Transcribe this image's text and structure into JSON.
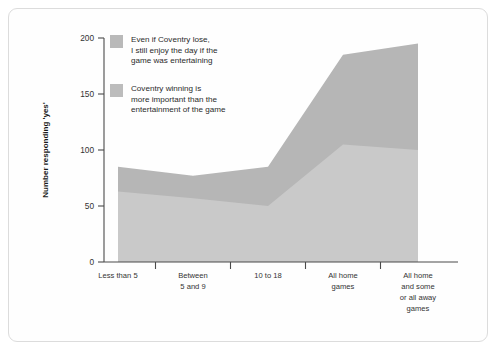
{
  "chart_data": {
    "type": "area",
    "title": "",
    "subtitle": "",
    "xlabel": "",
    "ylabel": "Number responding 'yes'",
    "ylim": [
      0,
      200
    ],
    "yticks": [
      0,
      50,
      100,
      150,
      200
    ],
    "ytick_labels": [
      "0",
      "50",
      "100",
      "150",
      "200"
    ],
    "grid": false,
    "stacked": false,
    "legend_position": "top-left inside plot",
    "categories": [
      "Less than 5",
      "Between 5 and 9",
      "10 to 18",
      "All home games",
      "All home and some or all away games"
    ],
    "category_label_lines": [
      [
        "Less than 5"
      ],
      [
        "Between",
        "5 and 9"
      ],
      [
        "10 to 18"
      ],
      [
        "All home",
        "games"
      ],
      [
        "All home",
        "and some",
        "or all away",
        "games"
      ]
    ],
    "series": [
      {
        "name": "Even if Coventry lose, I still enjoy the day if the game was entertaining",
        "color": "#b6b6b6",
        "values": [
          85,
          77,
          85,
          185,
          195
        ]
      },
      {
        "name": "Coventry winning is more important than the entertainment of the game",
        "color": "#c9c9c9",
        "values": [
          63,
          57,
          50,
          105,
          100
        ]
      }
    ]
  },
  "legend": {
    "items": [
      {
        "swatch_color": "#b9b9b9",
        "lines": [
          "Even if Coventry lose,",
          "I still enjoy the day if the",
          "game was entertaining"
        ]
      },
      {
        "swatch_color": "#bcbcbc",
        "lines": [
          "Coventry winning is",
          "more important than the",
          "entertainment of the game"
        ]
      }
    ]
  },
  "axes": {
    "y_title": "Number responding 'yes'",
    "y_tick_labels": [
      "200",
      "150",
      "100",
      "50",
      "0"
    ],
    "x_tick_labels": [
      "Less than 5",
      "Between 5 and 9",
      "10 to 18",
      "All home games",
      "All home and some or all away games"
    ]
  }
}
